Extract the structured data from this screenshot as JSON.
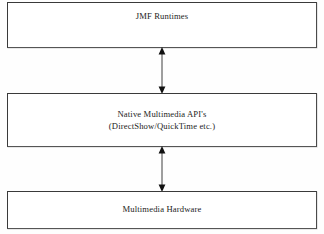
{
  "diagram": {
    "background_color": "#fefefe",
    "box_border_color": "#3a3a3a",
    "text_color": "#1c1c1c",
    "layers": [
      {
        "id": "jmf-runtimes",
        "label": "JMF Runtimes",
        "lines": [
          "JMF Runtimes"
        ]
      },
      {
        "id": "native-api",
        "label": "Native Multimedia API's",
        "lines": [
          "Native Multimedia API's",
          "(DirectShow/QuickTime etc.)"
        ]
      },
      {
        "id": "multimedia-hardware",
        "label": "Multimedia Hardware",
        "lines": [
          "Multimedia Hardware"
        ]
      }
    ],
    "connectors": [
      {
        "id": "runtimes-to-api",
        "icon": "double-headed-vertical-arrow-icon",
        "from": "JMF Runtimes",
        "to": "Native Multimedia API's",
        "direction": "bidirectional"
      },
      {
        "id": "api-to-hardware",
        "icon": "double-headed-vertical-arrow-icon",
        "from": "Native Multimedia API's",
        "to": "Multimedia Hardware",
        "direction": "bidirectional"
      }
    ]
  }
}
